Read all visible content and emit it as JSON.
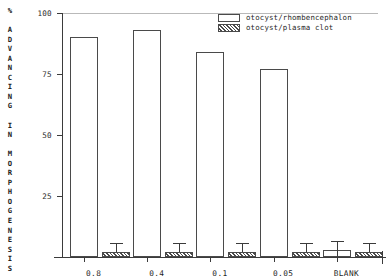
{
  "chart_data": {
    "type": "bar",
    "title": "",
    "xlabel": "",
    "ylabel": "% ADVANCING IN MORPHOGENESIS",
    "ylim": [
      0,
      100
    ],
    "yticks": [
      0,
      25,
      50,
      75,
      100
    ],
    "ytick_labels": [
      "",
      "25",
      "50",
      "75",
      "100"
    ],
    "grid": false,
    "legend_position": "top-right",
    "categories": [
      "0.8",
      "0.4",
      "0.1",
      "0.05",
      "BLANK"
    ],
    "series": [
      {
        "name": "otocyst/rhombencephalon",
        "fill": "white",
        "values": [
          90,
          93,
          84,
          77,
          3
        ],
        "errors": [
          0,
          0,
          0,
          0,
          2
        ]
      },
      {
        "name": "otocyst/plasma clot",
        "fill": "hatched",
        "values": [
          2,
          2,
          2,
          2,
          2
        ],
        "errors": [
          2,
          2,
          2,
          2,
          2
        ]
      }
    ]
  },
  "axis": {
    "y_title_chars": [
      "%",
      "",
      "A",
      "D",
      "V",
      "A",
      "N",
      "C",
      "I",
      "N",
      "G",
      "",
      "I",
      "N",
      "",
      "M",
      "O",
      "R",
      "P",
      "H",
      "O",
      "G",
      "E",
      "N",
      "E",
      "S",
      "I",
      "S"
    ],
    "y_tick_100": "100",
    "y_tick_75": "75",
    "y_tick_50": "50",
    "y_tick_25": "25"
  },
  "legend": {
    "items": [
      {
        "label": "otocyst/rhombencephalon",
        "swatch": "white-box"
      },
      {
        "label": "otocyst/plasma clot",
        "swatch": "hatched-box"
      }
    ]
  },
  "xlabels": [
    "0.8",
    "0.4",
    "0.1",
    "0.05",
    "BLANK"
  ],
  "colors": {
    "ink": "#1a1a1a",
    "axis": "#3b3b3b",
    "bar_edge": "#4a4a4a",
    "bar_fill": "#ffffff",
    "background": "#ffffff"
  }
}
